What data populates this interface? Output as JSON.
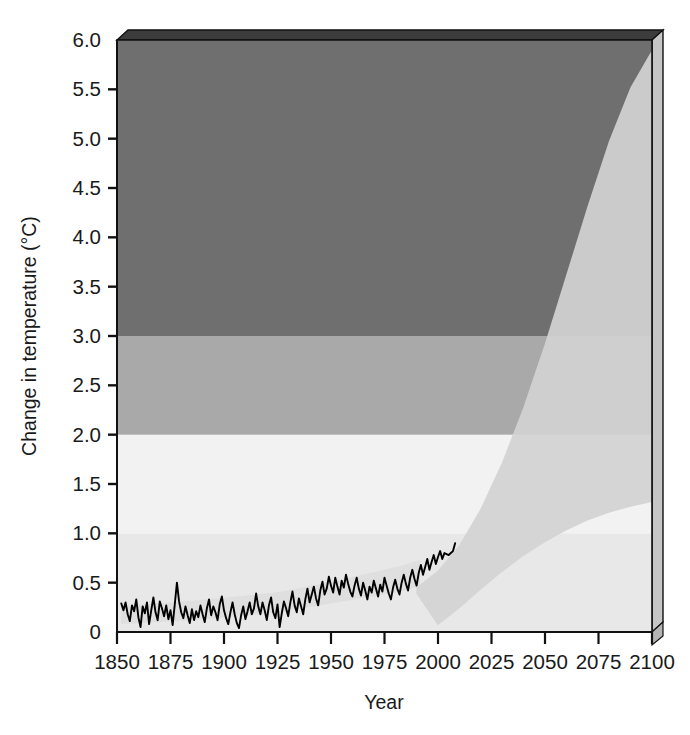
{
  "chart_data": {
    "type": "area",
    "title": "",
    "xlabel": "Year",
    "ylabel": "Change in temperature (°C)",
    "xlim": [
      1850,
      2100
    ],
    "ylim": [
      0,
      6.0
    ],
    "grid": false,
    "legend": "none",
    "x_ticks": [
      1850,
      1875,
      1900,
      1925,
      1950,
      1975,
      2000,
      2025,
      2050,
      2075,
      2100
    ],
    "x_tick_labels": [
      "1850",
      "1875",
      "1900",
      "1925",
      "1950",
      "1975",
      "2000",
      "2025",
      "2050",
      "2075",
      "2100"
    ],
    "y_ticks": [
      0,
      0.5,
      1.0,
      1.5,
      2.0,
      2.5,
      3.0,
      3.5,
      4.0,
      4.5,
      5.0,
      5.5,
      6.0
    ],
    "y_tick_labels": [
      "0",
      "0.5",
      "1.0",
      "1.5",
      "2.0",
      "2.5",
      "3.0",
      "3.5",
      "4.0",
      "4.5",
      "5.0",
      "5.5",
      "6.0"
    ],
    "background_bands": [
      {
        "name": "severe-risk-band",
        "from": 3.0,
        "to": 6.0,
        "color": "#6f6f6f"
      },
      {
        "name": "high-risk-band",
        "from": 2.0,
        "to": 3.0,
        "color": "#a9a9a9"
      },
      {
        "name": "moderate-risk-band",
        "from": 1.0,
        "to": 2.0,
        "color": "#f2f2f2"
      },
      {
        "name": "low-risk-band",
        "from": 0.0,
        "to": 1.0,
        "color": "#e8e8e8"
      }
    ],
    "projection_cone": {
      "name": "projection-uncertainty-range",
      "color": "#cfcfcf",
      "start_year": 1990,
      "end_year": 2100,
      "upper_bound_at_2100": 5.9,
      "lower_bound_at_2100": 1.3,
      "upper_bound": [
        {
          "year": 1990,
          "value": 0.45
        },
        {
          "year": 2000,
          "value": 0.62
        },
        {
          "year": 2010,
          "value": 0.88
        },
        {
          "year": 2020,
          "value": 1.25
        },
        {
          "year": 2030,
          "value": 1.72
        },
        {
          "year": 2040,
          "value": 2.28
        },
        {
          "year": 2050,
          "value": 2.92
        },
        {
          "year": 2060,
          "value": 3.62
        },
        {
          "year": 2070,
          "value": 4.32
        },
        {
          "year": 2080,
          "value": 4.98
        },
        {
          "year": 2090,
          "value": 5.52
        },
        {
          "year": 2100,
          "value": 5.9
        }
      ],
      "lower_bound": [
        {
          "year": 1990,
          "value": 0.32
        },
        {
          "year": 2000,
          "value": 0.4
        },
        {
          "year": 2010,
          "value": 0.5
        },
        {
          "year": 2020,
          "value": 0.62
        },
        {
          "year": 2030,
          "value": 0.74
        },
        {
          "year": 2040,
          "value": 0.86
        },
        {
          "year": 2050,
          "value": 0.96
        },
        {
          "year": 2060,
          "value": 1.06
        },
        {
          "year": 2070,
          "value": 1.14
        },
        {
          "year": 2080,
          "value": 1.21
        },
        {
          "year": 2090,
          "value": 1.27
        },
        {
          "year": 2100,
          "value": 1.32
        }
      ]
    },
    "series": [
      {
        "name": "observed-temperature",
        "label": "Observed temperature change",
        "color": "#000000",
        "start_year": 1852,
        "end_year": 2008,
        "values": [
          0.29,
          0.22,
          0.3,
          0.18,
          0.11,
          0.27,
          0.21,
          0.33,
          0.15,
          0.05,
          0.26,
          0.19,
          0.3,
          0.08,
          0.22,
          0.35,
          0.2,
          0.12,
          0.31,
          0.24,
          0.16,
          0.27,
          0.13,
          0.22,
          0.07,
          0.28,
          0.5,
          0.31,
          0.2,
          0.14,
          0.26,
          0.17,
          0.09,
          0.23,
          0.12,
          0.21,
          0.15,
          0.27,
          0.18,
          0.1,
          0.24,
          0.33,
          0.17,
          0.26,
          0.2,
          0.12,
          0.28,
          0.36,
          0.22,
          0.14,
          0.08,
          0.2,
          0.3,
          0.18,
          0.09,
          0.04,
          0.17,
          0.26,
          0.13,
          0.21,
          0.3,
          0.18,
          0.24,
          0.39,
          0.26,
          0.18,
          0.3,
          0.22,
          0.12,
          0.27,
          0.35,
          0.2,
          0.14,
          0.28,
          0.05,
          0.19,
          0.31,
          0.24,
          0.16,
          0.3,
          0.41,
          0.27,
          0.2,
          0.34,
          0.26,
          0.18,
          0.33,
          0.44,
          0.3,
          0.38,
          0.46,
          0.34,
          0.27,
          0.42,
          0.51,
          0.38,
          0.44,
          0.56,
          0.47,
          0.4,
          0.55,
          0.46,
          0.38,
          0.52,
          0.45,
          0.58,
          0.49,
          0.41,
          0.36,
          0.47,
          0.55,
          0.44,
          0.37,
          0.5,
          0.42,
          0.33,
          0.46,
          0.4,
          0.52,
          0.44,
          0.36,
          0.48,
          0.41,
          0.55,
          0.47,
          0.39,
          0.33,
          0.45,
          0.53,
          0.44,
          0.38,
          0.5,
          0.58,
          0.49,
          0.42,
          0.55,
          0.63,
          0.54,
          0.47,
          0.6,
          0.68,
          0.58,
          0.66,
          0.74,
          0.63,
          0.71,
          0.78,
          0.69,
          0.76,
          0.82,
          0.74,
          0.8,
          0.79,
          0.78,
          0.8,
          0.82,
          0.9
        ]
      }
    ]
  },
  "plot_box": {
    "name": "3d-plot-frame",
    "top_bevel_color": "#3c3c3c",
    "side_panel_color": "#c6c6c6",
    "outline_color": "#111111"
  }
}
